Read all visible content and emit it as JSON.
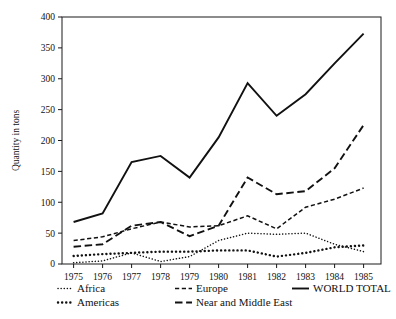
{
  "chart_data": {
    "type": "line",
    "title": "",
    "xlabel": "",
    "ylabel": "Quantity in tons",
    "x": [
      1975,
      1976,
      1977,
      1978,
      1979,
      1980,
      1981,
      1982,
      1983,
      1984,
      1985
    ],
    "xtick_labels": [
      "1975",
      "1976",
      "1977",
      "1978",
      "1979",
      "1980",
      "1981",
      "1982",
      "1983",
      "1984",
      "1985"
    ],
    "ytick_labels": [
      "0",
      "50",
      "100",
      "150",
      "200",
      "250",
      "300",
      "350",
      "400"
    ],
    "yticks": [
      0,
      50,
      100,
      150,
      200,
      250,
      300,
      350,
      400
    ],
    "ylim": [
      0,
      400
    ],
    "xlim": [
      1974.6,
      1985.6
    ],
    "grid": false,
    "legend_position": "below-axes",
    "series": [
      {
        "name": "Africa",
        "style": "fine-dotted",
        "values": [
          2,
          5,
          18,
          4,
          12,
          38,
          50,
          48,
          50,
          32,
          20
        ]
      },
      {
        "name": "Americas",
        "style": "bold-dotted",
        "values": [
          13,
          16,
          18,
          20,
          20,
          22,
          22,
          12,
          18,
          27,
          30
        ]
      },
      {
        "name": "Europe",
        "style": "short-dashed",
        "values": [
          38,
          44,
          57,
          68,
          60,
          62,
          78,
          57,
          92,
          105,
          123
        ]
      },
      {
        "name": "Near and Middle East",
        "style": "long-dashed",
        "values": [
          28,
          32,
          62,
          68,
          45,
          62,
          140,
          113,
          118,
          155,
          225
        ]
      },
      {
        "name": "WORLD TOTAL",
        "style": "solid",
        "values": [
          68,
          82,
          165,
          175,
          140,
          205,
          293,
          240,
          275,
          325,
          373
        ]
      }
    ]
  },
  "legend": {
    "entries": [
      {
        "label": "Africa",
        "style": "fine-dotted"
      },
      {
        "label": "Europe",
        "style": "short-dashed"
      },
      {
        "label": "WORLD TOTAL",
        "style": "solid"
      },
      {
        "label": "Americas",
        "style": "bold-dotted"
      },
      {
        "label": "Near and Middle East",
        "style": "long-dashed"
      }
    ]
  },
  "colors": {
    "ink": "#111111",
    "background": "#ffffff"
  }
}
